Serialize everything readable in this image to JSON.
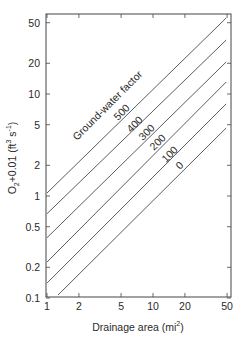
{
  "chart_data": {
    "type": "line",
    "title": "",
    "xlabel": "Drainage area (mi²)",
    "ylabel": "O₂+0.01 (ft³ s⁻¹)",
    "xscale": "log",
    "yscale": "log",
    "xlim": [
      1,
      55
    ],
    "ylim": [
      0.1,
      60
    ],
    "x_ticks": [
      1,
      2,
      5,
      10,
      20,
      50
    ],
    "x_tick_labels": [
      "1",
      "2",
      "5",
      "10",
      "20",
      "50"
    ],
    "y_ticks": [
      0.1,
      0.2,
      0.5,
      1,
      2,
      5,
      10,
      20,
      50
    ],
    "y_tick_labels": [
      "0.1",
      "0.2",
      "0.5",
      "1",
      "2",
      "5",
      "10",
      "20",
      "50"
    ],
    "grid": false,
    "legend": "none (lines labeled inline)",
    "annotation": "Ground-water factor",
    "series": [
      {
        "name": "500",
        "x": [
          1,
          49
        ],
        "y": [
          1.07,
          55.6
        ]
      },
      {
        "name": "400",
        "x": [
          1,
          49
        ],
        "y": [
          0.67,
          33.8
        ]
      },
      {
        "name": "300",
        "x": [
          1,
          49
        ],
        "y": [
          0.39,
          20.6
        ]
      },
      {
        "name": "200",
        "x": [
          1,
          49
        ],
        "y": [
          0.225,
          13.1
        ]
      },
      {
        "name": "100",
        "x": [
          1,
          49
        ],
        "y": [
          0.14,
          8.0
        ]
      },
      {
        "name": "0",
        "x": [
          1.27,
          49
        ],
        "y": [
          0.107,
          4.64
        ]
      }
    ]
  },
  "labels": {
    "annotation": "Ground-water factor",
    "xlabel_main": "Drainage area (mi",
    "xlabel_sup": "2",
    "xlabel_close": ")",
    "ylabel_main": "O",
    "ylabel_sub": "2",
    "ylabel_mid": "+0.01 (ft",
    "ylabel_sup1": "3",
    "ylabel_s": " s",
    "ylabel_sup2": "-1",
    "ylabel_close": ")"
  }
}
